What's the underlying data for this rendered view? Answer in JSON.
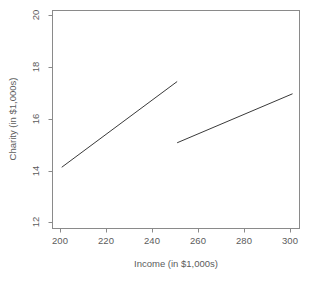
{
  "chart_data": {
    "type": "line",
    "title": "",
    "subtitle": "",
    "xlabel": "Income (in $1,000s)",
    "ylabel": "Charity (in $1,000s)",
    "xlim": [
      196,
      303
    ],
    "ylim": [
      11.5,
      20.4
    ],
    "xticks": [
      200,
      220,
      240,
      260,
      280,
      300
    ],
    "xtick_labels": [
      "200",
      "220",
      "240",
      "260",
      "280",
      "300"
    ],
    "yticks": [
      12,
      14,
      16,
      18,
      20
    ],
    "ytick_labels": [
      "12",
      "14",
      "16",
      "18",
      "20"
    ],
    "grid": false,
    "legend": false,
    "legend_position": "none",
    "series": [
      {
        "name": "segment-1",
        "x": [
          200,
          250
        ],
        "y": [
          14.0,
          17.5
        ],
        "color": "#3a3a3a"
      },
      {
        "name": "segment-2",
        "x": [
          250,
          300
        ],
        "y": [
          15.0,
          17.0
        ],
        "color": "#3a3a3a"
      }
    ],
    "annotations": []
  },
  "figure": {
    "background_color": "#ffffff",
    "frame_color": "#8a8a8a",
    "text_color": "#5c5c5c"
  }
}
